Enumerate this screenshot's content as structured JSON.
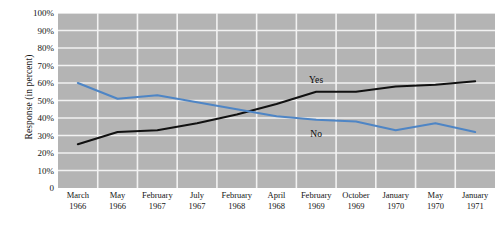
{
  "chart_data": {
    "type": "line",
    "title": "",
    "xlabel": "",
    "ylabel": "Response (in percent)",
    "ylim": [
      0,
      100
    ],
    "ytick_labels": [
      "100%",
      "90%",
      "80%",
      "70%",
      "60%",
      "50%",
      "40%",
      "30%",
      "20%",
      "10%",
      "0"
    ],
    "ytick_values": [
      100,
      90,
      80,
      70,
      60,
      50,
      40,
      30,
      20,
      10,
      0
    ],
    "grid": true,
    "legend_position": "inline-annotations",
    "categories": [
      "March 1966",
      "May 1966",
      "February 1967",
      "July 1967",
      "February 1968",
      "April 1968",
      "February 1969",
      "October 1969",
      "January 1970",
      "May 1970",
      "January 1971"
    ],
    "category_months": [
      "March",
      "May",
      "February",
      "July",
      "February",
      "April",
      "February",
      "October",
      "January",
      "May",
      "January"
    ],
    "category_years": [
      "1966",
      "1966",
      "1967",
      "1967",
      "1968",
      "1968",
      "1969",
      "1969",
      "1970",
      "1970",
      "1971"
    ],
    "series": [
      {
        "name": "Yes",
        "color": "#111111",
        "values": [
          25,
          32,
          33,
          37,
          42,
          48,
          55,
          55,
          58,
          59,
          61
        ]
      },
      {
        "name": "No",
        "color": "#4e85c5",
        "values": [
          60,
          51,
          53,
          49,
          45,
          41,
          39,
          38,
          33,
          37,
          32
        ]
      }
    ],
    "annotations": [
      {
        "text": "Yes",
        "series": "Yes",
        "category_index": 6,
        "value": 62
      },
      {
        "text": "No",
        "series": "No",
        "category_index": 6,
        "value": 31
      }
    ],
    "plot_background": "#b4b4b4",
    "grid_color": "#f2f2f2"
  }
}
